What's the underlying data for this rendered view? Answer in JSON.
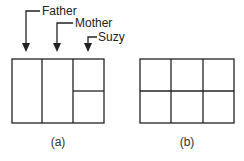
{
  "diagram": {
    "panel_a": {
      "caption": "(a)",
      "labels": [
        "Father",
        "Mother",
        "Suzy"
      ]
    },
    "panel_b": {
      "caption": "(b)"
    },
    "line_color": "#222222"
  }
}
